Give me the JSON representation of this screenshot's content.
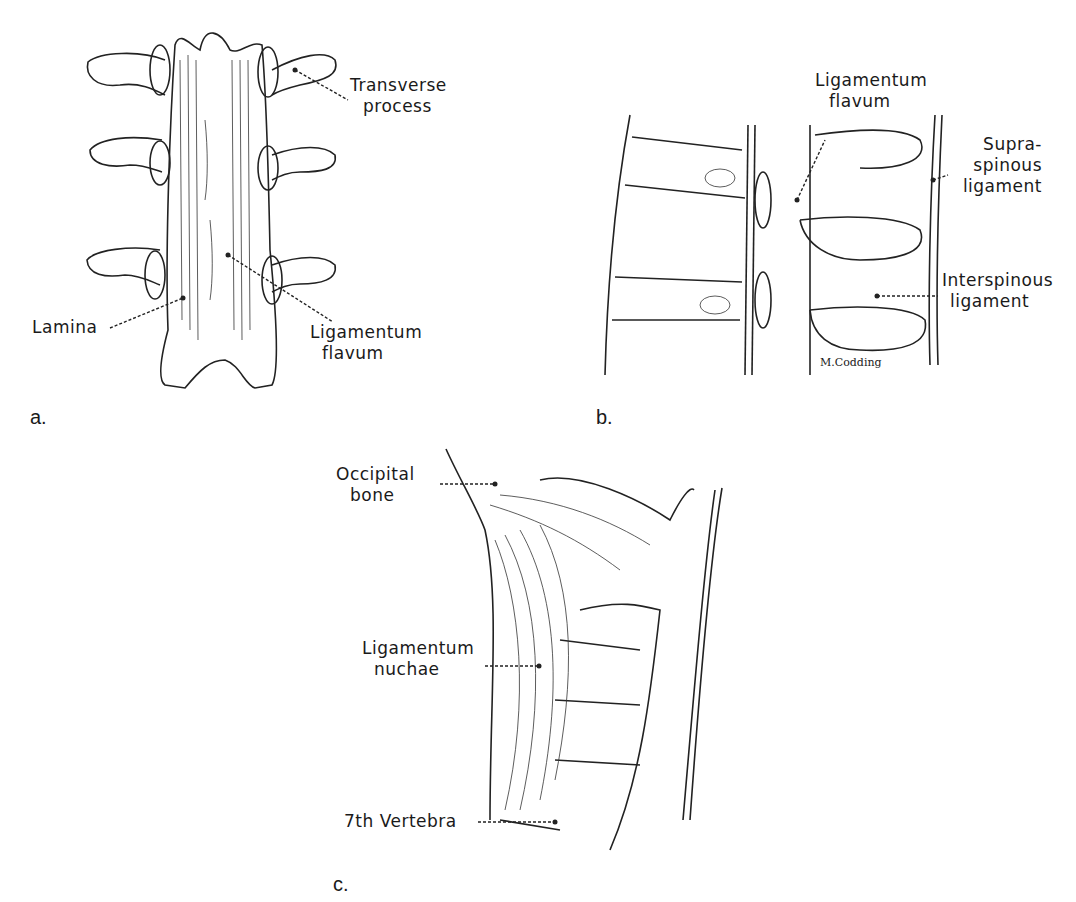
{
  "figure": {
    "panels": [
      {
        "letter": "a.",
        "subject": "lumbar vertebrae, posterior view",
        "labels": {
          "transverse_process": [
            "Transverse",
            "process"
          ],
          "lamina": [
            "Lamina"
          ],
          "ligamentum_flavum": [
            "Ligamentum",
            "flavum"
          ]
        }
      },
      {
        "letter": "b.",
        "subject": "vertebral column, sagittal section",
        "labels": {
          "ligamentum_flavum": [
            "Ligamentum",
            "flavum"
          ],
          "supraspinous_ligament": [
            "Supra-",
            "spinous",
            "ligament"
          ],
          "interspinous_ligament": [
            "Interspinous",
            "ligament"
          ]
        },
        "signature": "M.Codding"
      },
      {
        "letter": "c.",
        "subject": "cervical region, lateral view",
        "labels": {
          "occipital_bone": [
            "Occipital",
            "bone"
          ],
          "ligamentum_nuchae": [
            "Ligamentum",
            "nuchae"
          ],
          "seventh_vertebra": [
            "7th Vertebra"
          ]
        }
      }
    ]
  }
}
